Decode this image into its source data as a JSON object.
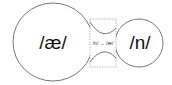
{
  "diagram": {
    "left_node": {
      "label": "/æ/",
      "cx": 53,
      "cy": 42,
      "rx": 40,
      "ry": 39
    },
    "right_node": {
      "label": "/n/",
      "cx": 139,
      "cy": 43,
      "r": 24
    },
    "transition": {
      "label": "/n/ → /æ/",
      "x": 90,
      "y": 19,
      "width": 26,
      "height": 48
    },
    "colors": {
      "stroke": "#555555",
      "dashed": "#888888",
      "text": "#111111",
      "background": "#ffffff"
    }
  }
}
